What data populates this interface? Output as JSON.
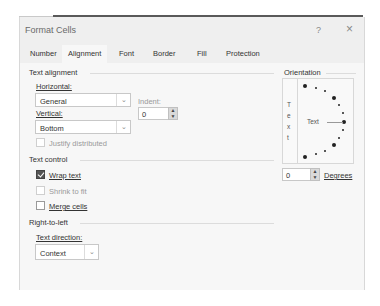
{
  "dialog": {
    "title": "Format Cells",
    "help_label": "?",
    "close_label": "×"
  },
  "tabs": [
    {
      "label": "Number",
      "active": false
    },
    {
      "label": "Alignment",
      "active": true
    },
    {
      "label": "Font",
      "active": false
    },
    {
      "label": "Border",
      "active": false
    },
    {
      "label": "Fill",
      "active": false
    },
    {
      "label": "Protection",
      "active": false
    }
  ],
  "text_alignment": {
    "group_label": "Text alignment",
    "horizontal_label": "Horizontal:",
    "horizontal_value": "General",
    "vertical_label": "Vertical:",
    "vertical_value": "Bottom",
    "indent_label": "Indent:",
    "indent_value": "0",
    "justify_distributed_label": "Justify distributed",
    "justify_distributed_checked": false,
    "justify_distributed_enabled": false
  },
  "text_control": {
    "group_label": "Text control",
    "wrap_text_label": "Wrap text",
    "wrap_text_checked": true,
    "shrink_to_fit_label": "Shrink to fit",
    "shrink_to_fit_checked": false,
    "shrink_to_fit_enabled": false,
    "merge_cells_label": "Merge cells",
    "merge_cells_checked": false
  },
  "right_to_left": {
    "group_label": "Right-to-left",
    "text_direction_label": "Text direction:",
    "text_direction_value": "Context"
  },
  "orientation": {
    "group_label": "Orientation",
    "vertical_text_letters": [
      "T",
      "e",
      "x",
      "t"
    ],
    "dial_text": "Text",
    "degrees_value": "0",
    "degrees_label": "Degrees"
  },
  "icons": {
    "chevron": "⌄",
    "spin_up": "▲",
    "spin_down": "▼"
  }
}
